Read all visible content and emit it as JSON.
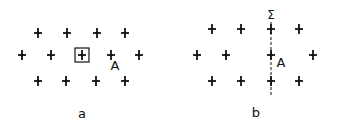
{
  "panels": [
    {
      "id": "a",
      "label": "a",
      "label_pos": [
        82,
        118
      ],
      "atom_label": "A",
      "atom_label_pos": [
        115,
        70
      ],
      "lattice_points": [
        [
          38,
          33
        ],
        [
          67,
          33
        ],
        [
          97,
          33
        ],
        [
          125,
          33
        ],
        [
          22,
          55
        ],
        [
          51,
          55
        ],
        [
          82,
          55
        ],
        [
          111,
          55
        ],
        [
          139,
          55
        ],
        [
          38,
          81
        ],
        [
          66,
          81
        ],
        [
          96,
          81
        ],
        [
          125,
          81
        ]
      ],
      "boxed_point": [
        82,
        55
      ]
    },
    {
      "id": "b",
      "label": "b",
      "label_pos": [
        256,
        117
      ],
      "atom_label": "A",
      "atom_label_pos": [
        281,
        67
      ],
      "mirror_label": "Σ",
      "mirror_label_pos": [
        271,
        19
      ],
      "mirror_line": {
        "x": 271,
        "y1": 22,
        "y2": 96
      },
      "lattice_points": [
        [
          212,
          29
        ],
        [
          241,
          29
        ],
        [
          271,
          29
        ],
        [
          299,
          29
        ],
        [
          197,
          55
        ],
        [
          226,
          55
        ],
        [
          271,
          55
        ],
        [
          313,
          55
        ],
        [
          212,
          81
        ],
        [
          241,
          81
        ],
        [
          271,
          81
        ],
        [
          299,
          81
        ]
      ]
    }
  ],
  "colors": {
    "ink": "#111111",
    "background": "#ffffff"
  }
}
